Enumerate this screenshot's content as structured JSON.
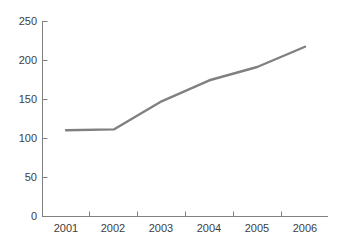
{
  "chart_data": {
    "type": "line",
    "title": "",
    "subtitle": "",
    "xlabel": "",
    "ylabel": "",
    "categories": [
      "2001",
      "2002",
      "2003",
      "2004",
      "2005",
      "2006"
    ],
    "series": [
      {
        "name": "series-1",
        "values": [
          110,
          111,
          147,
          174,
          191,
          217
        ],
        "color": "#808080"
      }
    ],
    "ylim": [
      0,
      250
    ],
    "yticks": [
      0,
      50,
      100,
      150,
      200,
      250
    ],
    "ytick_labels": [
      "0",
      "50",
      "100",
      "150",
      "200",
      "250"
    ],
    "grid": false,
    "legend": false,
    "legend_position": "none",
    "annotations": [],
    "axis_color": "#808080",
    "tick_label_color": "#404040",
    "background": "#ffffff"
  }
}
